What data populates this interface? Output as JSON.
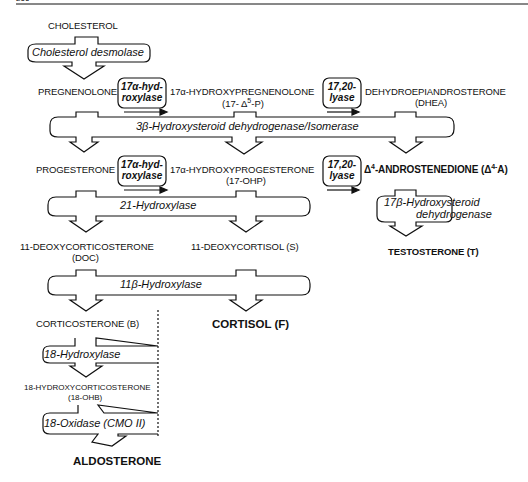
{
  "page": {
    "number": "266"
  },
  "compounds": {
    "cholesterol": "CHOLESTEROL",
    "pregnenolone": "PREGNENOLONE",
    "hydroxypregnenolone": "17α-HYDROXYPREGNENOLONE",
    "hydroxypregnenolone_abbr": "(17- Δ",
    "hydroxypregnenolone_abbr_sup": "5",
    "hydroxypregnenolone_abbr_end": "-P)",
    "dhea": "DEHYDROEPIANDROSTERONE",
    "dhea_abbr": "(DHEA)",
    "progesterone": "PROGESTERONE",
    "hydroxyprogesterone": "17α-HYDROXYPROGESTERONE",
    "hydroxyprogesterone_abbr": "(17-OHP)",
    "androstenedione_pre": "Δ",
    "androstenedione_sup": "4",
    "androstenedione": "-ANDROSTENEDIONE  (Δ",
    "androstenedione_sup2": "4-",
    "androstenedione_end": "A)",
    "doc": "11-DEOXYCORTICOSTERONE",
    "doc_abbr": "(DOC)",
    "deoxycortisol": "11-DEOXYCORTISOL  (S)",
    "testosterone": "TESTOSTERONE  (T)",
    "corticosterone": "CORTICOSTERONE  (B)",
    "cortisol": "CORTISOL  (F)",
    "hydroxycorticosterone": "18-HYDROXYCORTICOSTERONE",
    "hydroxycorticosterone_abbr": "(18-OHB)",
    "aldosterone": "ALDOSTERONE"
  },
  "enzymes": {
    "desmolase": "Cholesterol desmolase",
    "hydroxylase17_a": "17α-hyd-",
    "hydroxylase17_b": "roxylase",
    "lyase_a": "17,20-",
    "lyase_b": "lyase",
    "hsd3b": "3β-Hydroxysteroid dehydrogenase/Isomerase",
    "hydroxylase21": "21-Hydroxylase",
    "hsd17b_a": "17β-Hydroxysteroid",
    "hsd17b_b": "dehydrogenase",
    "hydroxylase11b": "11β-Hydroxylase",
    "hydroxylase18": "18-Hydroxylase",
    "oxidase18": "18-Oxidase  (CMO II)"
  }
}
